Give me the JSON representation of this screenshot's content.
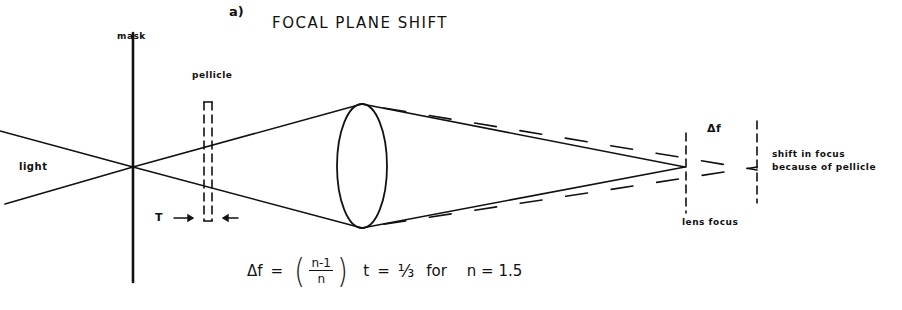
{
  "figure": {
    "panel_label": "a)",
    "title": "FOCAL PLANE SHIFT"
  },
  "labels": {
    "mask": "mask",
    "pellicle": "pellicle",
    "light": "light",
    "thickness": "T",
    "delta_f": "Δf",
    "lens_focus": "lens focus",
    "shift_line1": "shift in focus",
    "shift_line2": "because of pellicle"
  },
  "equation": {
    "lhs": "Δf",
    "equals": "=",
    "numerator": "n-1",
    "denominator": "n",
    "thickness_var": "t",
    "equals2": "=",
    "result": "⅓",
    "for_word": "for",
    "condition": "n = 1.5"
  },
  "colors": {
    "ink": "#111111",
    "background": "#ffffff"
  }
}
